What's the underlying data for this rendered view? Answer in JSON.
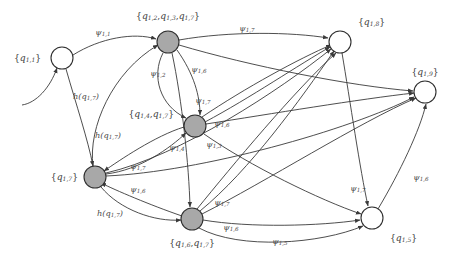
{
  "figure": {
    "kind": "finite-automaton-transition-diagram",
    "background_color": "#ffffff",
    "edge_color": "#3a3a3a",
    "accepting_fill": "#a8a8a8",
    "plain_fill": "#ffffff"
  },
  "states": [
    {
      "id": "s1",
      "label": "{q_{1,1}}",
      "label_text": "{q1,1}",
      "label_parts": {
        "open": "{",
        "sym": "q",
        "sub": "1,1",
        "close": "}"
      },
      "fill": "plain",
      "cx": 62,
      "cy": 58,
      "r": 11,
      "label_x": 14,
      "label_y": 58,
      "label_anchor": "start",
      "initial": true
    },
    {
      "id": "s2",
      "label": "{q_{1,2},q_{1,3},q_{1,7}}",
      "label_text": "{q1,2,q1,3,q1,7}",
      "label_parts_multi": [
        {
          "open": "{",
          "sym": "q",
          "sub": "1,2",
          "close": ","
        },
        {
          "open": "",
          "sym": "q",
          "sub": "1,3",
          "close": ","
        },
        {
          "open": "",
          "sym": "q",
          "sub": "1,7",
          "close": "}"
        }
      ],
      "fill": "accept",
      "cx": 168,
      "cy": 42,
      "r": 11,
      "label_x": 168,
      "label_y": 16,
      "label_anchor": "middle"
    },
    {
      "id": "s3",
      "label": "{q_{1,4},q_{1,7}}",
      "label_text": "{q1,4,q1,7}",
      "label_parts_multi": [
        {
          "open": "{",
          "sym": "q",
          "sub": "1,4",
          "close": ","
        },
        {
          "open": "",
          "sym": "q",
          "sub": "1,7",
          "close": "}"
        }
      ],
      "fill": "accept",
      "cx": 195,
      "cy": 126,
      "r": 11,
      "label_x": 174,
      "label_y": 114,
      "label_anchor": "end"
    },
    {
      "id": "s4",
      "label": "{q_{1,7}}",
      "label_text": "{q1,7}",
      "label_parts": {
        "open": "{",
        "sym": "q",
        "sub": "1,7",
        "close": "}"
      },
      "fill": "accept",
      "cx": 95,
      "cy": 177,
      "r": 11,
      "label_x": 78,
      "label_y": 177,
      "label_anchor": "end"
    },
    {
      "id": "s5",
      "label": "{q_{1,6},q_{1,7}}",
      "label_text": "{q1,6,q1,7}",
      "label_parts_multi": [
        {
          "open": "{",
          "sym": "q",
          "sub": "1,6",
          "close": ","
        },
        {
          "open": "",
          "sym": "q",
          "sub": "1,7",
          "close": "}"
        }
      ],
      "fill": "accept",
      "cx": 192,
      "cy": 219,
      "r": 11,
      "label_x": 192,
      "label_y": 243,
      "label_anchor": "middle"
    },
    {
      "id": "s6",
      "label": "{q_{1,8}}",
      "label_text": "{q1,8}",
      "label_parts": {
        "open": "{",
        "sym": "q",
        "sub": "1,8",
        "close": "}"
      },
      "fill": "plain",
      "cx": 340,
      "cy": 42,
      "r": 11,
      "label_x": 358,
      "label_y": 22,
      "label_anchor": "start"
    },
    {
      "id": "s7",
      "label": "{q_{1,9}}",
      "label_text": "{q1,9}",
      "label_parts": {
        "open": "{",
        "sym": "q",
        "sub": "1,9",
        "close": "}"
      },
      "fill": "plain",
      "cx": 425,
      "cy": 92,
      "r": 11,
      "label_x": 425,
      "label_y": 72,
      "label_anchor": "middle"
    },
    {
      "id": "s8",
      "label": "{q_{1,5}}",
      "label_text": "{q1,5}",
      "label_parts": {
        "open": "{",
        "sym": "q",
        "sub": "1,5",
        "close": "}"
      },
      "fill": "plain",
      "cx": 372,
      "cy": 218,
      "r": 11,
      "label_x": 390,
      "label_y": 238,
      "label_anchor": "start"
    }
  ],
  "edge_labels": [
    {
      "id": "e1",
      "text": "psi_{1,1}",
      "sym": "ψ",
      "sub": "1,1",
      "x": 103,
      "y": 33,
      "anchor": "middle"
    },
    {
      "id": "e2",
      "text": "psi_{1,7}",
      "sym": "ψ",
      "sub": "1,7",
      "x": 247,
      "y": 29,
      "anchor": "middle"
    },
    {
      "id": "e3",
      "text": "psi_{1,2}",
      "sym": "ψ",
      "sub": "1,2",
      "x": 158,
      "y": 74,
      "anchor": "middle"
    },
    {
      "id": "e4",
      "text": "psi_{1,6}",
      "sym": "ψ",
      "sub": "1,6",
      "x": 199,
      "y": 70,
      "anchor": "middle"
    },
    {
      "id": "e5",
      "text": "psi_{1,7}",
      "sym": "ψ",
      "sub": "1,7",
      "x": 203,
      "y": 101,
      "anchor": "middle"
    },
    {
      "id": "e6",
      "text": "h(q_{1,7})",
      "sym": "h",
      "sub": "1,7",
      "x": 86,
      "y": 97,
      "anchor": "middle",
      "kind": "h"
    },
    {
      "id": "e7",
      "text": "h(q_{1,7})",
      "sym": "h",
      "sub": "1,7",
      "x": 108,
      "y": 136,
      "anchor": "middle",
      "kind": "h"
    },
    {
      "id": "e8",
      "text": "psi_{1,6}",
      "sym": "ψ",
      "sub": "1,6",
      "x": 222,
      "y": 124,
      "anchor": "middle"
    },
    {
      "id": "e9",
      "text": "psi_{1,3}",
      "sym": "ψ",
      "sub": "1,3",
      "x": 214,
      "y": 145,
      "anchor": "middle"
    },
    {
      "id": "e10",
      "text": "psi_{1,4}",
      "sym": "ψ",
      "sub": "1,4",
      "x": 177,
      "y": 148,
      "anchor": "middle"
    },
    {
      "id": "e11",
      "text": "psi_{1,7}",
      "sym": "ψ",
      "sub": "1,7",
      "x": 138,
      "y": 167,
      "anchor": "middle"
    },
    {
      "id": "e12",
      "text": "psi_{1,6}",
      "sym": "ψ",
      "sub": "1,6",
      "x": 138,
      "y": 190,
      "anchor": "middle"
    },
    {
      "id": "e13",
      "text": "h(q_{1,7})",
      "sym": "h",
      "sub": "1,7",
      "x": 110,
      "y": 214,
      "anchor": "middle",
      "kind": "h"
    },
    {
      "id": "e14",
      "text": "psi_{1,7}",
      "sym": "ψ",
      "sub": "1,7",
      "x": 222,
      "y": 203,
      "anchor": "middle"
    },
    {
      "id": "e15",
      "text": "psi_{1,6}",
      "sym": "ψ",
      "sub": "1,6",
      "x": 231,
      "y": 228,
      "anchor": "middle"
    },
    {
      "id": "e16",
      "text": "psi_{1,5}",
      "sym": "ψ",
      "sub": "1,5",
      "x": 280,
      "y": 242,
      "anchor": "middle"
    },
    {
      "id": "e17",
      "text": "psi_{1,7}",
      "sym": "ψ",
      "sub": "1,7",
      "x": 358,
      "y": 189,
      "anchor": "middle"
    },
    {
      "id": "e18",
      "text": "psi_{1,6}",
      "sym": "ψ",
      "sub": "1,6",
      "x": 421,
      "y": 178,
      "anchor": "middle"
    }
  ],
  "edges": [
    {
      "id": "t1",
      "from": "start",
      "to": "s1",
      "d": "M 22,105 C 36,103 50,88 57,68",
      "arrow": true
    },
    {
      "id": "t2",
      "from": "s1",
      "to": "s2",
      "d": "M 73,55 C 100,38 134,32 156,39",
      "arrow": true
    },
    {
      "id": "t3",
      "from": "s2",
      "to": "s6",
      "d": "M 179,40 C 230,31 292,32 328,38",
      "arrow": true
    },
    {
      "id": "t4",
      "from": "s2",
      "to": "s3",
      "d": "M 163,53 C 151,76 160,106 186,118",
      "arrow": true
    },
    {
      "id": "t5",
      "from": "s2",
      "to": "s5",
      "d": "M 172,53 C 182,100 189,166 190,207",
      "arrow": true
    },
    {
      "id": "t6",
      "from": "s2",
      "to": "s7",
      "d": "M 179,45 C 250,66 350,86 413,91",
      "arrow": true
    },
    {
      "id": "t7",
      "from": "s2",
      "to": "s3",
      "d": "M 177,50 C 194,74 200,96 200,115",
      "arrow": true
    },
    {
      "id": "t8",
      "from": "s4",
      "to": "s2",
      "d": "M 93,166 C 88,128 112,72 158,45",
      "arrow": true
    },
    {
      "id": "t9",
      "from": "s1",
      "to": "s4",
      "d": "M 66,69 C 76,104 88,140 93,166",
      "arrow": true
    },
    {
      "id": "t10",
      "from": "s3",
      "to": "s6",
      "d": "M 205,122 C 250,98 300,64 330,47",
      "arrow": true
    },
    {
      "id": "t11",
      "from": "s3",
      "to": "s7",
      "d": "M 206,124 C 270,114 360,99 414,93",
      "arrow": true
    },
    {
      "id": "t12",
      "from": "s3",
      "to": "s8",
      "d": "M 204,134 C 250,166 320,200 361,214",
      "arrow": true
    },
    {
      "id": "t13",
      "from": "s3",
      "to": "s4",
      "d": "M 184,127 C 155,136 120,160 104,171",
      "arrow": true
    },
    {
      "id": "t14",
      "from": "s4",
      "to": "s3",
      "d": "M 106,174 C 140,170 170,148 186,133",
      "arrow": true
    },
    {
      "id": "t15",
      "from": "s4",
      "to": "s6",
      "d": "M 106,173 C 180,156 280,90 331,49",
      "arrow": true
    },
    {
      "id": "t16",
      "from": "s4",
      "to": "s7",
      "d": "M 106,176 C 200,172 350,130 414,97",
      "arrow": true
    },
    {
      "id": "t17",
      "from": "s4",
      "to": "s5",
      "d": "M 101,187 C 120,210 155,222 181,220",
      "arrow": true
    },
    {
      "id": "t18",
      "from": "s5",
      "to": "s4",
      "d": "M 182,216 C 150,205 115,190 101,183",
      "arrow": true
    },
    {
      "id": "t19",
      "from": "s5",
      "to": "s6",
      "d": "M 197,209 C 232,166 295,90 336,53",
      "arrow": true
    },
    {
      "id": "t20",
      "from": "s5",
      "to": "s7",
      "d": "M 202,214 C 265,182 360,122 416,98",
      "arrow": true
    },
    {
      "id": "t21",
      "from": "s5",
      "to": "s8",
      "d": "M 203,220 C 250,228 320,226 360,220",
      "arrow": true
    },
    {
      "id": "t22",
      "from": "s5",
      "to": "s8",
      "d": "M 199,228 C 240,250 320,244 363,226",
      "arrow": true
    },
    {
      "id": "t23",
      "from": "s6",
      "to": "s8",
      "d": "M 342,53 C 350,100 360,170 368,206",
      "arrow": true
    },
    {
      "id": "t24",
      "from": "s8",
      "to": "s7",
      "d": "M 378,209 C 400,172 420,130 426,104",
      "arrow": true
    },
    {
      "id": "t25",
      "from": "s3",
      "to": "s6",
      "d": "M 202,117 C 245,88 300,58 331,45",
      "arrow": true
    },
    {
      "id": "t26",
      "from": "s5",
      "to": "s6",
      "d": "M 200,211 C 250,170 300,100 334,51",
      "arrow": true
    }
  ]
}
